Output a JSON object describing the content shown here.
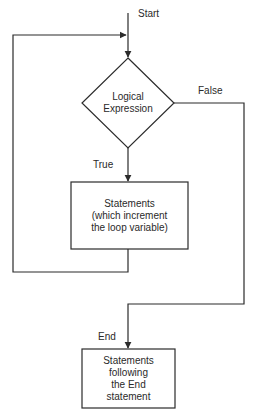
{
  "diagram": {
    "type": "flowchart",
    "colors": {
      "stroke": "#2b2b2b",
      "text": "#2a2a2a",
      "background": "#ffffff"
    },
    "labels": {
      "start": "Start",
      "false": "False",
      "true": "True",
      "end": "End"
    },
    "nodes": {
      "decision": {
        "shape": "diamond",
        "lines": [
          "Logical",
          "Expression"
        ]
      },
      "loop_body": {
        "shape": "rectangle",
        "lines": [
          "Statements",
          "(which increment",
          "the loop variable)"
        ]
      },
      "after_loop": {
        "shape": "rectangle",
        "lines": [
          "Statements",
          "following",
          "the End",
          "statement"
        ]
      }
    },
    "edges": [
      {
        "from": "start",
        "to": "decision"
      },
      {
        "from": "decision",
        "to": "loop_body",
        "label": "True"
      },
      {
        "from": "loop_body",
        "to": "decision",
        "label": "loop back"
      },
      {
        "from": "decision",
        "to": "after_loop",
        "label": "False"
      }
    ]
  }
}
